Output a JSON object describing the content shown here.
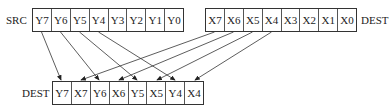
{
  "diagram": {
    "src": {
      "label": "SRC",
      "cells": [
        "Y7",
        "Y6",
        "Y5",
        "Y4",
        "Y3",
        "Y2",
        "Y1",
        "Y0"
      ]
    },
    "dest_in": {
      "label": "DEST",
      "cells": [
        "X7",
        "X6",
        "X5",
        "X4",
        "X3",
        "X2",
        "X1",
        "X0"
      ]
    },
    "dest_out": {
      "label": "DEST",
      "cells": [
        "Y7",
        "X7",
        "Y6",
        "X6",
        "Y5",
        "X5",
        "Y4",
        "X4"
      ]
    },
    "arrows": [
      {
        "from": "SRC.Y7",
        "to": "DEST_OUT.0"
      },
      {
        "from": "SRC.Y6",
        "to": "DEST_OUT.2"
      },
      {
        "from": "SRC.Y5",
        "to": "DEST_OUT.4"
      },
      {
        "from": "SRC.Y4",
        "to": "DEST_OUT.6"
      },
      {
        "from": "DEST_IN.X7",
        "to": "DEST_OUT.1"
      },
      {
        "from": "DEST_IN.X6",
        "to": "DEST_OUT.3"
      },
      {
        "from": "DEST_IN.X5",
        "to": "DEST_OUT.5"
      },
      {
        "from": "DEST_IN.X4",
        "to": "DEST_OUT.7"
      }
    ]
  }
}
